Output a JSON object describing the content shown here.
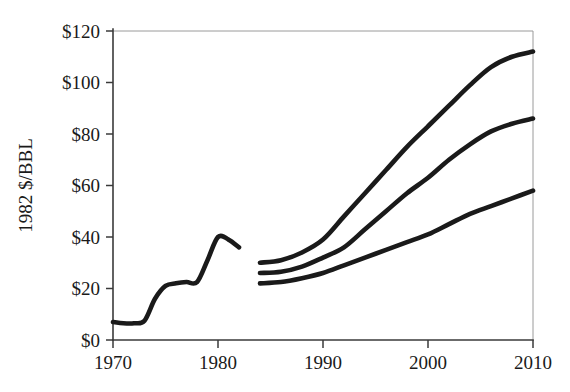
{
  "chart_data": {
    "type": "line",
    "title": "",
    "subtitle": "",
    "xlabel": "",
    "ylabel": "1982 $/BBL",
    "xlim": [
      1970,
      2010
    ],
    "ylim": [
      0,
      120
    ],
    "grid": false,
    "legend": "none",
    "x_ticks": [
      1970,
      1980,
      1990,
      2000,
      2010
    ],
    "x_tick_labels": [
      "1970",
      "1980",
      "1990",
      "2000",
      "2010"
    ],
    "y_ticks": [
      0,
      20,
      40,
      60,
      80,
      100,
      120
    ],
    "y_tick_labels": [
      "$0",
      "$20",
      "$40",
      "$60",
      "$80",
      "$100",
      "$120"
    ],
    "series": [
      {
        "name": "Historical",
        "x": [
          1970,
          1971,
          1972,
          1973,
          1974,
          1975,
          1976,
          1977,
          1978,
          1979,
          1980,
          1981,
          1982
        ],
        "values": [
          7,
          6.5,
          6.5,
          7.5,
          16,
          21,
          22,
          22.5,
          22.5,
          31,
          40,
          39,
          36
        ]
      },
      {
        "name": "High forecast",
        "x": [
          1984,
          1986,
          1988,
          1990,
          1992,
          1994,
          1996,
          1998,
          2000,
          2002,
          2004,
          2006,
          2008,
          2010
        ],
        "values": [
          30,
          31,
          34,
          39,
          48,
          57,
          66,
          75,
          83,
          91,
          99,
          106,
          110,
          112
        ]
      },
      {
        "name": "Middle forecast",
        "x": [
          1984,
          1986,
          1988,
          1990,
          1992,
          1994,
          1996,
          1998,
          2000,
          2002,
          2004,
          2006,
          2008,
          2010
        ],
        "values": [
          26,
          26.5,
          28.5,
          32,
          36,
          43,
          50,
          57,
          63,
          70,
          76,
          81,
          84,
          86
        ]
      },
      {
        "name": "Low forecast",
        "x": [
          1984,
          1986,
          1988,
          1990,
          1992,
          1994,
          1996,
          1998,
          2000,
          2002,
          2004,
          2006,
          2008,
          2010
        ],
        "values": [
          22,
          22.5,
          24,
          26,
          29,
          32,
          35,
          38,
          41,
          45,
          49,
          52,
          55,
          58
        ]
      }
    ],
    "colors": {
      "series": "#1a1a1a",
      "axis": "#3a3a3a",
      "frame": "#9a9a9a",
      "background": "#ffffff"
    }
  }
}
